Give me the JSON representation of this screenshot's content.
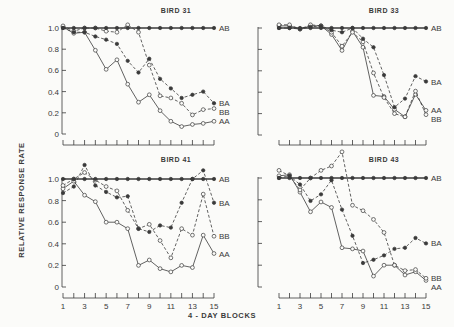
{
  "chart_data": {
    "type": "line",
    "figure": {
      "ylabel": "RELATIVE RESPONSE RATE",
      "xlabel": "4 - DAY BLOCKS",
      "x": [
        1,
        2,
        3,
        4,
        5,
        6,
        7,
        8,
        9,
        10,
        11,
        12,
        13,
        14,
        15
      ],
      "x_tick_labels": [
        "1",
        "3",
        "5",
        "7",
        "9",
        "11",
        "13",
        "15"
      ],
      "y_tick_labels": [
        "0",
        "0.2",
        "0.4",
        "0.6",
        "0.8",
        "1.0"
      ],
      "ylim": [
        0,
        1.1
      ],
      "grid": false,
      "legend": "inline labels at right end of each series",
      "series_styles": {
        "AB": {
          "marker": "filled",
          "line": "solid"
        },
        "BA": {
          "marker": "filled",
          "line": "dashed"
        },
        "BB": {
          "marker": "open",
          "line": "dashed"
        },
        "AA": {
          "marker": "open",
          "line": "solid"
        }
      }
    },
    "panels": [
      {
        "title": "BIRD 31",
        "series": [
          {
            "name": "AB",
            "values": [
              1.0,
              1.0,
              1.0,
              1.0,
              1.0,
              1.0,
              1.0,
              1.0,
              1.0,
              1.0,
              1.0,
              1.0,
              1.0,
              1.0,
              1.0
            ]
          },
          {
            "name": "BA",
            "values": [
              1.0,
              0.96,
              0.96,
              0.92,
              0.89,
              0.85,
              0.69,
              0.58,
              0.71,
              0.52,
              0.43,
              0.34,
              0.37,
              0.4,
              0.29
            ]
          },
          {
            "name": "BB",
            "values": [
              1.02,
              0.97,
              1.0,
              1.0,
              0.97,
              0.96,
              1.03,
              0.96,
              0.65,
              0.36,
              0.34,
              0.29,
              0.18,
              0.23,
              0.24
            ]
          },
          {
            "name": "AA",
            "values": [
              1.01,
              0.95,
              0.96,
              0.79,
              0.61,
              0.7,
              0.47,
              0.3,
              0.37,
              0.22,
              0.12,
              0.07,
              0.09,
              0.1,
              0.12
            ]
          }
        ]
      },
      {
        "title": "BIRD 33",
        "series": [
          {
            "name": "AB",
            "values": [
              1.0,
              1.0,
              1.0,
              1.0,
              1.0,
              1.0,
              1.0,
              1.0,
              1.0,
              1.0,
              1.0,
              1.0,
              1.0,
              1.0,
              1.0
            ]
          },
          {
            "name": "BA",
            "values": [
              1.0,
              1.0,
              0.99,
              1.01,
              1.02,
              0.98,
              0.96,
              1.0,
              0.9,
              0.82,
              0.56,
              0.26,
              0.34,
              0.55,
              0.5
            ]
          },
          {
            "name": "BB",
            "values": [
              1.03,
              1.03,
              0.99,
              1.03,
              1.02,
              0.96,
              0.83,
              0.96,
              0.87,
              0.58,
              0.35,
              0.2,
              0.17,
              0.41,
              0.19
            ]
          },
          {
            "name": "AA",
            "values": [
              1.02,
              1.02,
              0.99,
              1.02,
              1.02,
              0.94,
              0.79,
              0.97,
              0.82,
              0.37,
              0.36,
              0.24,
              0.17,
              0.38,
              0.23
            ]
          }
        ]
      },
      {
        "title": "BIRD 41",
        "series": [
          {
            "name": "AB",
            "values": [
              1.0,
              1.0,
              1.0,
              1.0,
              1.0,
              1.0,
              1.0,
              1.0,
              1.0,
              1.0,
              1.0,
              1.0,
              1.0,
              1.0,
              1.0
            ]
          },
          {
            "name": "BA",
            "values": [
              0.87,
              0.93,
              1.13,
              0.94,
              0.88,
              0.83,
              0.84,
              0.54,
              0.51,
              0.57,
              0.55,
              0.78,
              1.0,
              1.08,
              0.78
            ]
          },
          {
            "name": "BB",
            "values": [
              0.94,
              1.0,
              1.06,
              0.99,
              0.93,
              0.89,
              0.71,
              0.54,
              0.58,
              0.43,
              0.27,
              0.54,
              0.48,
              0.86,
              0.47
            ]
          },
          {
            "name": "AA",
            "values": [
              0.91,
              0.98,
              0.85,
              0.79,
              0.6,
              0.6,
              0.54,
              0.2,
              0.25,
              0.17,
              0.14,
              0.2,
              0.18,
              0.48,
              0.31
            ]
          }
        ]
      },
      {
        "title": "BIRD 43",
        "series": [
          {
            "name": "AB",
            "values": [
              1.0,
              1.0,
              1.0,
              1.0,
              1.0,
              1.0,
              1.0,
              1.0,
              1.0,
              1.0,
              1.0,
              1.0,
              1.0,
              1.0,
              1.0
            ]
          },
          {
            "name": "BA",
            "values": [
              1.0,
              1.02,
              0.94,
              0.79,
              0.85,
              0.98,
              0.71,
              0.47,
              0.22,
              0.25,
              0.29,
              0.35,
              0.36,
              0.45,
              0.4
            ]
          },
          {
            "name": "BB",
            "values": [
              1.07,
              1.02,
              0.89,
              1.0,
              1.07,
              1.11,
              1.24,
              0.75,
              0.7,
              0.62,
              0.5,
              0.2,
              0.15,
              0.16,
              0.08
            ]
          },
          {
            "name": "AA",
            "values": [
              1.02,
              1.03,
              0.87,
              0.69,
              0.78,
              0.73,
              0.36,
              0.35,
              0.33,
              0.1,
              0.2,
              0.2,
              0.11,
              0.14,
              0.06
            ]
          }
        ]
      }
    ]
  }
}
